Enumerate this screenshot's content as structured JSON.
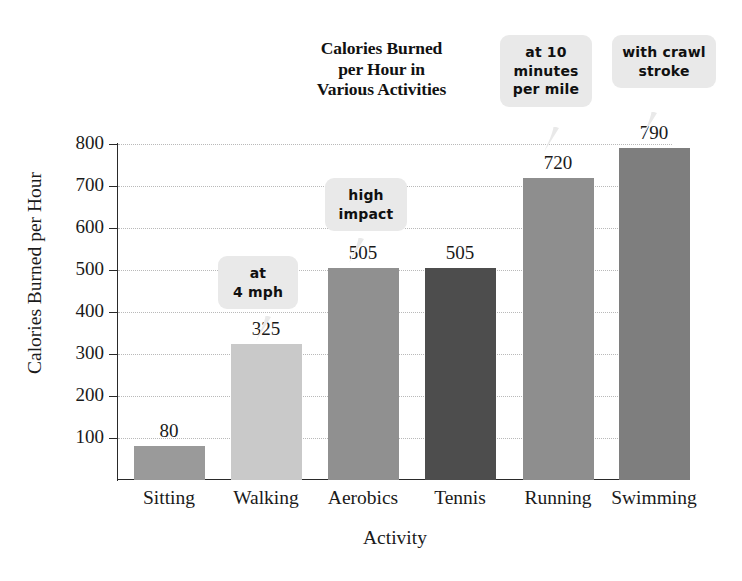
{
  "chart_data": {
    "type": "bar",
    "title": "Calories Burned per Hour in Various Activities",
    "title_lines": [
      "Calories Burned",
      "per Hour in",
      "Various Activities"
    ],
    "xlabel": "Activity",
    "ylabel": "Calories Burned per Hour",
    "categories": [
      "Sitting",
      "Walking",
      "Aerobics",
      "Tennis",
      "Running",
      "Swimming"
    ],
    "values": [
      80,
      325,
      505,
      505,
      720,
      790
    ],
    "value_labels": [
      "80",
      "325",
      "505",
      "505",
      "720",
      "790"
    ],
    "ylim": [
      0,
      800
    ],
    "ytick_values": [
      100,
      200,
      300,
      400,
      500,
      600,
      700,
      800
    ],
    "ytick_labels": [
      "100",
      "200",
      "300",
      "400",
      "500",
      "600",
      "700",
      "800"
    ],
    "grid": "horizontal-dotted",
    "legend": "none",
    "bar_colors": [
      "#9a9a9a",
      "#c9c9c9",
      "#909090",
      "#4d4d4d",
      "#8e8e8e",
      "#7e7e7e"
    ],
    "annotations": [
      {
        "target": "Walking",
        "lines": [
          "at",
          "4 mph"
        ]
      },
      {
        "target": "Aerobics",
        "lines": [
          "high",
          "impact"
        ]
      },
      {
        "target": "Running",
        "lines": [
          "at 10",
          "minutes",
          "per mile"
        ]
      },
      {
        "target": "Swimming",
        "lines": [
          "with crawl",
          "stroke"
        ]
      }
    ],
    "colors": {
      "background": "#ffffff",
      "axis": "#2a2a2a",
      "gridline": "#b9b9b9",
      "text": "#1a1a1a",
      "callout_background": "#e9e9e9"
    }
  }
}
